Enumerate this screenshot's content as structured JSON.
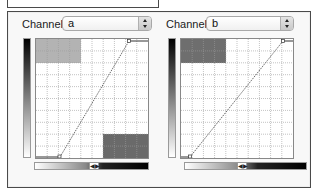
{
  "panels": [
    {
      "label": "Channel:",
      "selected": "a",
      "graph": {
        "grid": {
          "cols": 10,
          "rows": 10
        },
        "blocks": [
          {
            "name": "top-left-block",
            "col": 0,
            "row": 0,
            "cols": 4,
            "rows": 2,
            "color": "#b3b3b3"
          },
          {
            "name": "bottom-right-block",
            "col": 6,
            "row": 8,
            "cols": 4,
            "rows": 2,
            "color": "#6a6a6a"
          }
        ],
        "curve": {
          "start": [
            0.21,
            0.0
          ],
          "end": [
            0.83,
            0.98
          ]
        }
      }
    },
    {
      "label": "Channel:",
      "selected": "b",
      "graph": {
        "grid": {
          "cols": 10,
          "rows": 10
        },
        "blocks": [
          {
            "name": "top-left-block",
            "col": 0,
            "row": 0,
            "cols": 4,
            "rows": 2,
            "color": "#6e6e6e"
          }
        ],
        "curve": {
          "start": [
            0.08,
            0.0
          ],
          "end": [
            0.91,
            0.98
          ]
        }
      }
    }
  ],
  "icons": {
    "stepper": "up-down-arrows",
    "knob": "◀▶"
  }
}
